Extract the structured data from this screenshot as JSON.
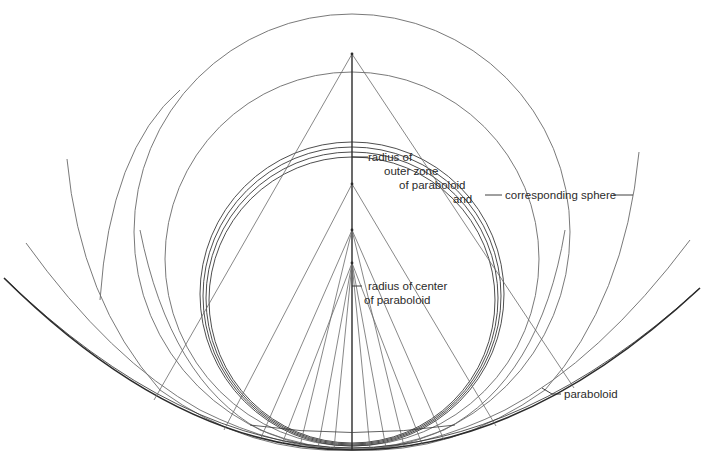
{
  "figure": {
    "header_fragment": "",
    "labels": {
      "outer_zone_line1": "radius of",
      "outer_zone_line2": "outer zone",
      "outer_zone_line3": "of paraboloid",
      "and": "and",
      "corresponding_sphere": "corresponding sphere",
      "center_line1": "radius of center",
      "center_line2": "of paraboloid",
      "paraboloid": "paraboloid"
    },
    "colors": {
      "background": "#ffffff",
      "line": "#3a3a3a",
      "thin_line": "#6a6a6a",
      "text": "#2b2b2b"
    },
    "geometry": {
      "axis_x": 352,
      "vertex_y": 448,
      "apex_y": 54,
      "focal_points_y": [
        54,
        184,
        230,
        263
      ],
      "circles": [
        {
          "cx": 352,
          "cy": 233,
          "r": 218
        },
        {
          "cx": 352,
          "cy": 260,
          "r": 186
        },
        {
          "cx": 352,
          "cy": 294,
          "r": 151
        },
        {
          "cx": 352,
          "cy": 296,
          "r": 148
        },
        {
          "cx": 352,
          "cy": 298,
          "r": 145
        }
      ]
    }
  }
}
